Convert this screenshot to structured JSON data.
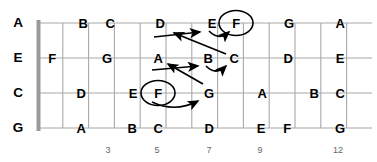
{
  "diagram": {
    "name": "guitar-fretboard-note-map",
    "geometry": {
      "nut_x": 37,
      "fret_width": 25.8,
      "first_fret_x": 37,
      "string_ys": [
        23,
        58,
        93,
        128
      ],
      "frets_shown": 13,
      "board_left": 37,
      "board_right": 372
    },
    "colors": {
      "grid": "#a8a8a8",
      "nut": "#9a9a9a",
      "text": "#000000",
      "fret_number": "#666666",
      "arrow": "#000000",
      "background": "#ffffff"
    }
  },
  "open_strings": [
    {
      "label": "A",
      "x": 18,
      "y": 23
    },
    {
      "label": "E",
      "x": 18,
      "y": 58
    },
    {
      "label": "C",
      "x": 18,
      "y": 93
    },
    {
      "label": "G",
      "x": 18,
      "y": 128
    }
  ],
  "fret_numbers": [
    {
      "label": "3",
      "x": 108,
      "y": 150
    },
    {
      "label": "5",
      "x": 157,
      "y": 150
    },
    {
      "label": "7",
      "x": 209,
      "y": 150
    },
    {
      "label": "9",
      "x": 260,
      "y": 150
    },
    {
      "label": "12",
      "x": 338,
      "y": 150
    }
  ],
  "notes": [
    {
      "label": "B",
      "string": 0,
      "fret": 2,
      "x": 83,
      "y": 23
    },
    {
      "label": "C",
      "string": 0,
      "fret": 3,
      "x": 110,
      "y": 23
    },
    {
      "label": "D",
      "string": 0,
      "fret": 5,
      "x": 160,
      "y": 23
    },
    {
      "label": "E",
      "string": 0,
      "fret": 7,
      "x": 212,
      "y": 23
    },
    {
      "label": "F",
      "string": 0,
      "fret": 8,
      "x": 236,
      "y": 23
    },
    {
      "label": "G",
      "string": 0,
      "fret": 10,
      "x": 289,
      "y": 23
    },
    {
      "label": "A",
      "string": 0,
      "fret": 12,
      "x": 340,
      "y": 23
    },
    {
      "label": "F",
      "string": 1,
      "fret": 1,
      "x": 52,
      "y": 58
    },
    {
      "label": "G",
      "string": 1,
      "fret": 3,
      "x": 107,
      "y": 58
    },
    {
      "label": "A",
      "string": 1,
      "fret": 5,
      "x": 158,
      "y": 58
    },
    {
      "label": "B",
      "string": 1,
      "fret": 7,
      "x": 208,
      "y": 58
    },
    {
      "label": "C",
      "string": 1,
      "fret": 8,
      "x": 234,
      "y": 58
    },
    {
      "label": "D",
      "string": 1,
      "fret": 10,
      "x": 288,
      "y": 58
    },
    {
      "label": "E",
      "string": 1,
      "fret": 12,
      "x": 340,
      "y": 58
    },
    {
      "label": "D",
      "string": 2,
      "fret": 2,
      "x": 81,
      "y": 93
    },
    {
      "label": "E",
      "string": 2,
      "fret": 4,
      "x": 133,
      "y": 93
    },
    {
      "label": "F",
      "string": 2,
      "fret": 5,
      "x": 158,
      "y": 93
    },
    {
      "label": "G",
      "string": 2,
      "fret": 7,
      "x": 209,
      "y": 93
    },
    {
      "label": "A",
      "string": 2,
      "fret": 9,
      "x": 262,
      "y": 93
    },
    {
      "label": "B",
      "string": 2,
      "fret": 11,
      "x": 314,
      "y": 93
    },
    {
      "label": "C",
      "string": 2,
      "fret": 12,
      "x": 340,
      "y": 93
    },
    {
      "label": "A",
      "string": 3,
      "fret": 2,
      "x": 81,
      "y": 128
    },
    {
      "label": "B",
      "string": 3,
      "fret": 4,
      "x": 132,
      "y": 128
    },
    {
      "label": "C",
      "string": 3,
      "fret": 5,
      "x": 158,
      "y": 128
    },
    {
      "label": "D",
      "string": 3,
      "fret": 7,
      "x": 209,
      "y": 128
    },
    {
      "label": "E",
      "string": 3,
      "fret": 9,
      "x": 261,
      "y": 128
    },
    {
      "label": "F",
      "string": 3,
      "fret": 10,
      "x": 287,
      "y": 128
    },
    {
      "label": "G",
      "string": 3,
      "fret": 12,
      "x": 340,
      "y": 128
    }
  ],
  "circled_notes": [
    {
      "label": "F",
      "x": 236,
      "y": 23,
      "rx": 17,
      "ry": 12.5
    },
    {
      "label": "F",
      "x": 158,
      "y": 93,
      "rx": 17,
      "ry": 12.5
    }
  ],
  "arrows": [
    {
      "name": "arrow-c-to-d",
      "from": "C (string 2, fret 8)",
      "to": "D (string 1, fret 5)"
    },
    {
      "name": "arrow-d-to-e",
      "from": "D (string 1, fret 5)",
      "to": "E (string 1, fret 7)"
    },
    {
      "name": "arrow-e-to-f",
      "from": "E (string 1, fret 7)",
      "to": "F (string 1, fret 8)"
    },
    {
      "name": "arrow-g-to-a",
      "from": "G (string 3, fret 7)",
      "to": "A (string 2, fret 5)"
    },
    {
      "name": "arrow-a-to-b",
      "from": "A (string 2, fret 5)",
      "to": "B (string 2, fret 7)"
    },
    {
      "name": "arrow-b-to-c",
      "from": "B (string 2, fret 7)",
      "to": "C (string 2, fret 8)"
    },
    {
      "name": "arrow-f-to-g",
      "from": "F (string 3, fret 5)",
      "to": "G (string 3, fret 7)"
    }
  ]
}
